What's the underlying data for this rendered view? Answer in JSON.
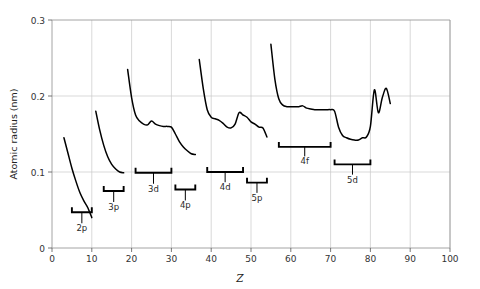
{
  "chart_data": {
    "type": "line",
    "title": "",
    "xlabel": "Z",
    "ylabel": "Atomic radius (nm)",
    "xlim": [
      0,
      100
    ],
    "ylim": [
      0,
      0.3
    ],
    "xticks": [
      0,
      10,
      20,
      30,
      40,
      50,
      60,
      70,
      80,
      90,
      100
    ],
    "xtick_labels": [
      "0",
      "10",
      "20",
      "30",
      "40",
      "50",
      "60",
      "70",
      "80",
      "90",
      "100"
    ],
    "yticks": [
      0,
      0.1,
      0.2,
      0.3
    ],
    "ytick_labels": [
      "0",
      "0.1",
      "0.2",
      "0.3"
    ],
    "grid": true,
    "legend": "none",
    "curve_color": "#000000",
    "grid_color": "#c9c9c9",
    "series": [
      {
        "name": "period-2",
        "x": [
          3,
          4,
          5,
          6,
          7,
          8,
          9,
          10
        ],
        "values": [
          0.145,
          0.125,
          0.105,
          0.088,
          0.073,
          0.062,
          0.053,
          0.04
        ]
      },
      {
        "name": "period-3",
        "x": [
          11,
          12,
          13,
          14,
          15,
          16,
          17,
          18
        ],
        "values": [
          0.18,
          0.155,
          0.135,
          0.12,
          0.11,
          0.104,
          0.1,
          0.099
        ]
      },
      {
        "name": "period-4",
        "x": [
          19,
          20,
          21,
          22,
          23,
          24,
          25,
          26,
          27,
          28,
          29,
          30,
          31,
          32,
          33,
          34,
          35,
          36
        ],
        "values": [
          0.235,
          0.198,
          0.175,
          0.167,
          0.163,
          0.162,
          0.167,
          0.163,
          0.161,
          0.16,
          0.16,
          0.159,
          0.15,
          0.14,
          0.133,
          0.128,
          0.124,
          0.123
        ]
      },
      {
        "name": "period-5",
        "x": [
          37,
          38,
          39,
          40,
          41,
          42,
          43,
          44,
          45,
          46,
          47,
          48,
          49,
          50,
          51,
          52,
          53,
          54
        ],
        "values": [
          0.248,
          0.21,
          0.182,
          0.172,
          0.17,
          0.168,
          0.164,
          0.159,
          0.158,
          0.163,
          0.178,
          0.175,
          0.172,
          0.166,
          0.163,
          0.159,
          0.158,
          0.146
        ]
      },
      {
        "name": "period-6",
        "x": [
          55,
          56,
          57,
          58,
          59,
          60,
          61,
          62,
          63,
          64,
          65,
          66,
          67,
          68,
          69,
          70,
          71,
          72,
          73,
          74,
          75,
          76,
          77,
          78,
          79,
          80,
          81,
          82,
          83,
          84,
          85
        ],
        "values": [
          0.268,
          0.222,
          0.196,
          0.188,
          0.186,
          0.186,
          0.186,
          0.186,
          0.187,
          0.184,
          0.183,
          0.182,
          0.182,
          0.182,
          0.182,
          0.182,
          0.18,
          0.159,
          0.148,
          0.145,
          0.143,
          0.142,
          0.142,
          0.145,
          0.146,
          0.16,
          0.208,
          0.178,
          0.198,
          0.21,
          0.19
        ]
      }
    ],
    "shell_brackets": [
      {
        "label": "2p",
        "z_start": 5,
        "z_end": 10,
        "bracket_y": 0.047,
        "label_y": 0.022
      },
      {
        "label": "3p",
        "z_start": 13,
        "z_end": 18,
        "bracket_y": 0.075,
        "label_y": 0.05
      },
      {
        "label": "3d",
        "z_start": 21,
        "z_end": 30,
        "bracket_y": 0.099,
        "label_y": 0.074
      },
      {
        "label": "4p",
        "z_start": 31,
        "z_end": 36,
        "bracket_y": 0.077,
        "label_y": 0.052
      },
      {
        "label": "4d",
        "z_start": 39,
        "z_end": 48,
        "bracket_y": 0.1,
        "label_y": 0.076
      },
      {
        "label": "5p",
        "z_start": 49,
        "z_end": 54,
        "bracket_y": 0.086,
        "label_y": 0.062
      },
      {
        "label": "4f",
        "z_start": 57,
        "z_end": 70,
        "bracket_y": 0.133,
        "label_y": 0.11
      },
      {
        "label": "5d",
        "z_start": 71,
        "z_end": 80,
        "bracket_y": 0.11,
        "label_y": 0.086
      }
    ]
  }
}
